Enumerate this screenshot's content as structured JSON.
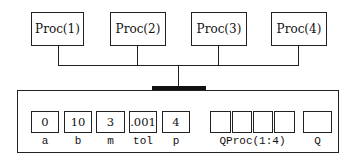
{
  "processors": [
    {
      "label": "Proc(1)"
    },
    {
      "label": "Proc(2)"
    },
    {
      "label": "Proc(3)"
    },
    {
      "label": "Proc(4)"
    }
  ],
  "memory": {
    "variables": [
      {
        "value": "0",
        "name": "a"
      },
      {
        "value": "10",
        "name": "b"
      },
      {
        "value": "3",
        "name": "m"
      },
      {
        "value": ".001",
        "name": "tol"
      },
      {
        "value": "4",
        "name": "p"
      }
    ],
    "array": {
      "name": "QProc(1:4)",
      "cells": [
        "",
        "",
        "",
        ""
      ]
    },
    "scalar": {
      "name": "Q",
      "value": ""
    }
  }
}
